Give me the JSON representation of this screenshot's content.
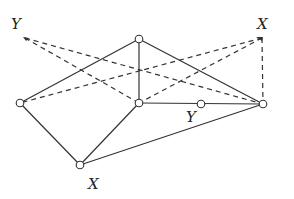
{
  "diagram": {
    "type": "graph-figure",
    "nodes": [
      {
        "id": "top",
        "x": 139,
        "y": 39
      },
      {
        "id": "center",
        "x": 139,
        "y": 103
      },
      {
        "id": "right",
        "x": 263,
        "y": 104
      },
      {
        "id": "left",
        "x": 20,
        "y": 103
      },
      {
        "id": "bottom",
        "x": 80,
        "y": 165
      },
      {
        "id": "mid",
        "x": 201,
        "y": 104
      }
    ],
    "points": [
      {
        "id": "Y-point",
        "x": 25,
        "y": 38
      },
      {
        "id": "X-point",
        "x": 262,
        "y": 38
      }
    ],
    "solid_edges": [
      [
        "left",
        "top"
      ],
      [
        "top",
        "right"
      ],
      [
        "top",
        "center"
      ],
      [
        "center",
        "right"
      ],
      [
        "left",
        "bottom"
      ],
      [
        "bottom",
        "center"
      ],
      [
        "bottom",
        "right"
      ]
    ],
    "dashed_edges": [
      [
        "Y-point",
        "center"
      ],
      [
        "Y-point",
        "right"
      ],
      [
        "X-point",
        "left"
      ],
      [
        "X-point",
        "center"
      ],
      [
        "X-point",
        "right"
      ]
    ],
    "labels": {
      "top_left": "Y",
      "top_right": "X",
      "bottom": "X",
      "middle": "Y"
    }
  }
}
